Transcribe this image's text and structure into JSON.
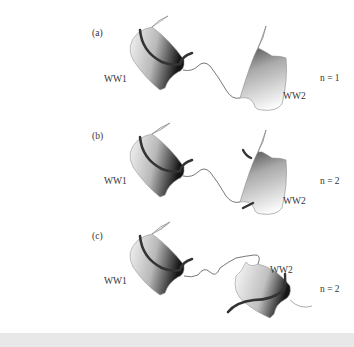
{
  "panels": [
    {
      "tag": "(a)",
      "left_domain": "WW1",
      "right_domain": "WW2",
      "n_label": "n = 1"
    },
    {
      "tag": "(b)",
      "left_domain": "WW1",
      "right_domain": "WW2",
      "n_label": "n = 2"
    },
    {
      "tag": "(c)",
      "left_domain": "WW1",
      "right_domain": "WW2",
      "n_label": "n = 2"
    }
  ],
  "colors": {
    "sheet_light": "#f4f4f4",
    "sheet_dark": "#1a1a1a",
    "ligand": "#3a3a3a",
    "linker": "#555555",
    "bottom_band": "#e8e8e8"
  }
}
